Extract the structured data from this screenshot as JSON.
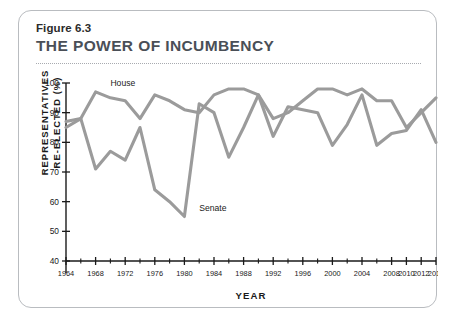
{
  "figure": {
    "number": "Figure 6.3",
    "title": "THE POWER OF INCUMBENCY"
  },
  "chart_data": {
    "type": "line",
    "title": "THE POWER OF INCUMBENCY",
    "xlabel": "YEAR",
    "ylabel": "REPRESENTATIVES RE-ELECTED (%)",
    "ylabel_line1": "REPRESENTATIVES",
    "ylabel_line2": "RE-ELECTED (%)",
    "xlim": [
      1964,
      2014
    ],
    "ylim": [
      40,
      100
    ],
    "yticks": [
      40,
      50,
      60,
      70,
      80,
      90,
      100
    ],
    "ytick_labels": [
      "40",
      "50",
      "60",
      "70",
      "80",
      "90",
      "100"
    ],
    "xticks_major": [
      1964,
      1968,
      1972,
      1976,
      1980,
      1984,
      1988,
      1992,
      1996,
      2000,
      2004,
      2008,
      2010,
      2012,
      2014
    ],
    "xtick_labels": [
      "1964",
      "1968",
      "1972",
      "1976",
      "1980",
      "1984",
      "1988",
      "1992",
      "1996",
      "2000",
      "2004",
      "2008",
      "2010",
      "2012",
      "2014"
    ],
    "xticks_minor": [
      1966,
      1970,
      1974,
      1978,
      1982,
      1986,
      1990,
      1994,
      1998,
      2002,
      2006
    ],
    "grid": false,
    "legend_position": "inline-annotation",
    "x": [
      1964,
      1966,
      1968,
      1970,
      1972,
      1974,
      1976,
      1978,
      1980,
      1982,
      1984,
      1986,
      1988,
      1990,
      1992,
      1994,
      1996,
      1998,
      2000,
      2002,
      2004,
      2006,
      2008,
      2010,
      2012,
      2014
    ],
    "series": [
      {
        "name": "House",
        "color": "#9b9b9b",
        "values": [
          87,
          88,
          97,
          95,
          94,
          88,
          96,
          94,
          91,
          90,
          96,
          98,
          98,
          96,
          88,
          90,
          94,
          98,
          98,
          96,
          98,
          94,
          94,
          85,
          90,
          95
        ]
      },
      {
        "name": "Senate",
        "color": "#9b9b9b",
        "values": [
          85,
          88,
          71,
          77,
          74,
          85,
          64,
          60,
          55,
          93,
          90,
          75,
          85,
          96,
          82,
          92,
          91,
          90,
          79,
          86,
          96,
          79,
          83,
          84,
          91,
          80
        ]
      }
    ],
    "annotations": [
      {
        "text": "House",
        "x": 1970,
        "y": 99
      },
      {
        "text": "Senate",
        "x": 1982,
        "y": 57
      }
    ]
  }
}
